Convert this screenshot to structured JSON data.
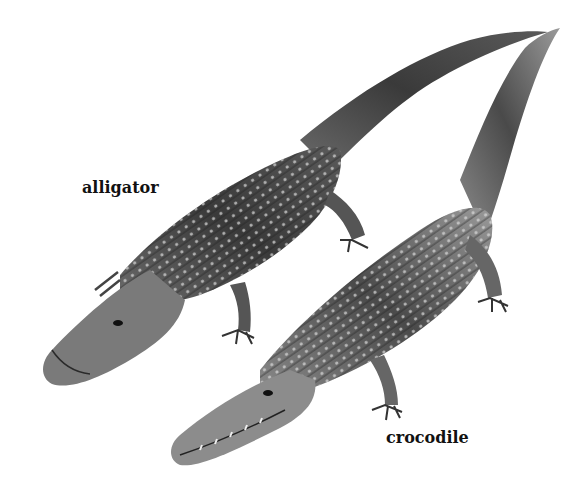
{
  "illustration": {
    "description": "Grayscale drawing comparing an alligator and a crocodile",
    "background": "#ffffff",
    "labels": {
      "alligator": "alligator",
      "crocodile": "crocodile"
    },
    "animals": [
      {
        "name": "alligator",
        "snout": "broad, rounded (U-shaped)"
      },
      {
        "name": "crocodile",
        "snout": "narrow, pointed (V-shaped), teeth visible"
      }
    ]
  }
}
